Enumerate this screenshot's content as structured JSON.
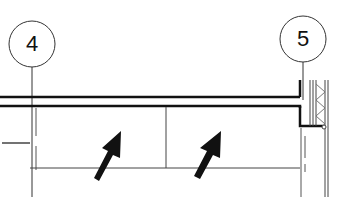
{
  "drawing": {
    "type": "architectural-plan-detail",
    "grid_bubbles": [
      {
        "label": "4",
        "cx": 32,
        "cy": 44,
        "r": 23
      },
      {
        "label": "5",
        "cx": 303,
        "cy": 39,
        "r": 23
      }
    ],
    "arrows": [
      {
        "name": "arrow-left",
        "direction": "up-right"
      },
      {
        "name": "arrow-right",
        "direction": "up-right"
      }
    ],
    "colors": {
      "line": "#1a1a1a",
      "background": "#ffffff",
      "thin_line": "#555555"
    }
  }
}
